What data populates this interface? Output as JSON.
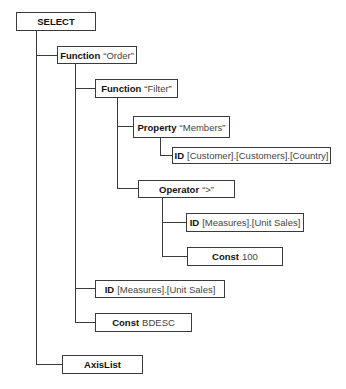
{
  "diagram": {
    "type": "tree",
    "nodes": [
      {
        "id": "select",
        "keyword": "SELECT",
        "value": ""
      },
      {
        "id": "function-order",
        "keyword": "Function",
        "value": "“Order”"
      },
      {
        "id": "function-filter",
        "keyword": "Function",
        "value": "“Filter”"
      },
      {
        "id": "property-members",
        "keyword": "Property",
        "value": "“Members”"
      },
      {
        "id": "id-customer-country",
        "keyword": "ID",
        "value": "[Customer].[Customers].[Country]"
      },
      {
        "id": "operator-gt",
        "keyword": "Operator",
        "value": "“>”"
      },
      {
        "id": "id-measures-unit-sales-1",
        "keyword": "ID",
        "value": "[Measures].[Unit Sales]"
      },
      {
        "id": "const-100",
        "keyword": "Const",
        "value": "100"
      },
      {
        "id": "id-measures-unit-sales-2",
        "keyword": "ID",
        "value": "[Measures].[Unit Sales]"
      },
      {
        "id": "const-bdesc",
        "keyword": "Const",
        "value": "BDESC"
      },
      {
        "id": "axislist",
        "keyword": "AxisList",
        "value": ""
      }
    ],
    "edges": [
      [
        "select",
        "function-order"
      ],
      [
        "select",
        "axislist"
      ],
      [
        "function-order",
        "function-filter"
      ],
      [
        "function-order",
        "id-measures-unit-sales-2"
      ],
      [
        "function-order",
        "const-bdesc"
      ],
      [
        "function-filter",
        "property-members"
      ],
      [
        "function-filter",
        "operator-gt"
      ],
      [
        "property-members",
        "id-customer-country"
      ],
      [
        "operator-gt",
        "id-measures-unit-sales-1"
      ],
      [
        "operator-gt",
        "const-100"
      ]
    ]
  }
}
